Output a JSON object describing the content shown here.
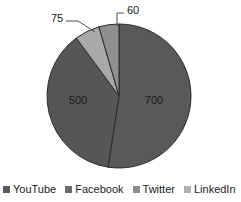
{
  "chart_data": {
    "type": "pie",
    "title": "",
    "subtitle": "",
    "xlabel": "",
    "ylabel": "",
    "grid": false,
    "legend_position": "bottom",
    "total": 1335,
    "start_angle_deg": 0,
    "direction": "clockwise",
    "categories": [
      "YouTube",
      "Facebook",
      "Twitter",
      "LinkedIn"
    ],
    "values": [
      700,
      500,
      75,
      60
    ],
    "slices": [
      {
        "label": "YouTube",
        "value": "700",
        "numeric": 700,
        "color": "#595959",
        "angle_deg": 188.8,
        "label_placement": "inside",
        "label_x": 154,
        "label_y": 101
      },
      {
        "label": "Facebook",
        "value": "500",
        "numeric": 500,
        "color": "#565656",
        "angle_deg": 134.8,
        "label_placement": "inside",
        "label_x": 78,
        "label_y": 101
      },
      {
        "label": "Twitter",
        "value": "75",
        "numeric": 75,
        "color": "#a9a9a9",
        "angle_deg": 20.2,
        "label_placement": "outside",
        "label_x": 57,
        "label_y": 19
      },
      {
        "label": "LinkedIn",
        "value": "60",
        "numeric": 60,
        "color": "#8f8f8f",
        "angle_deg": 16.2,
        "label_placement": "outside",
        "label_x": 133,
        "label_y": 11
      }
    ]
  },
  "legend": {
    "items": [
      {
        "label": "YouTube",
        "color": "#595959"
      },
      {
        "label": "Facebook",
        "color": "#6b6b6b"
      },
      {
        "label": "Twitter",
        "color": "#8f8f8f"
      },
      {
        "label": "LinkedIn",
        "color": "#b0b0b0"
      }
    ]
  },
  "colors": {
    "background": "#ffffff",
    "text": "#1a1a1a",
    "slice_border": "#2b2b2b",
    "leader_line": "#4d4d4d"
  }
}
